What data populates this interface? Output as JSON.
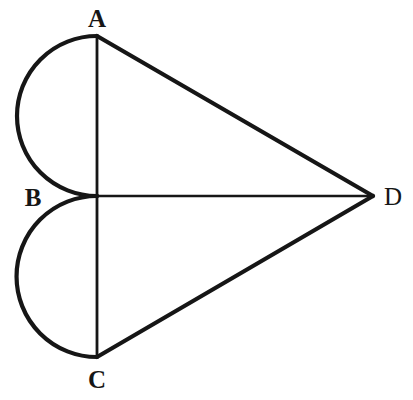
{
  "figure": {
    "background_color": "#ffffff",
    "stroke_color": "#161616",
    "canvas": {
      "width": 413,
      "height": 400
    },
    "labels": [
      {
        "id": "A",
        "text": "A",
        "x": 97,
        "y": 18,
        "weight": "bold"
      },
      {
        "id": "B",
        "text": "B",
        "x": 33,
        "y": 197,
        "weight": "bold"
      },
      {
        "id": "C",
        "text": "C",
        "x": 97,
        "y": 379,
        "weight": "bold"
      },
      {
        "id": "D",
        "text": "D",
        "x": 393,
        "y": 196,
        "weight": "normal"
      }
    ],
    "points": {
      "A": {
        "x": 97,
        "y": 36
      },
      "B": {
        "x": 97,
        "y": 196
      },
      "C": {
        "x": 97,
        "y": 357
      },
      "D": {
        "x": 373,
        "y": 196
      }
    },
    "segments": [
      {
        "name": "segment-AD",
        "from": "A",
        "to": "D",
        "stroke_width": 4.2
      },
      {
        "name": "segment-CD",
        "from": "C",
        "to": "D",
        "stroke_width": 4.2
      },
      {
        "name": "segment-AC",
        "from": "A",
        "to": "C",
        "stroke_width": 2.8
      },
      {
        "name": "segment-BD",
        "from": "B",
        "to": "D",
        "stroke_width": 2.6
      }
    ],
    "arcs": [
      {
        "name": "semicircle-AB",
        "from": "A",
        "to": "B",
        "radius": 80,
        "bulge": "left",
        "path": "M 97 36 A 80 80 0 0 0 97 196",
        "stroke_width": 4.2
      },
      {
        "name": "semicircle-BC",
        "from": "B",
        "to": "C",
        "radius": 80.5,
        "bulge": "left",
        "path": "M 97 196 A 80.5 80.5 0 0 0 97 357",
        "stroke_width": 4.2
      }
    ]
  }
}
